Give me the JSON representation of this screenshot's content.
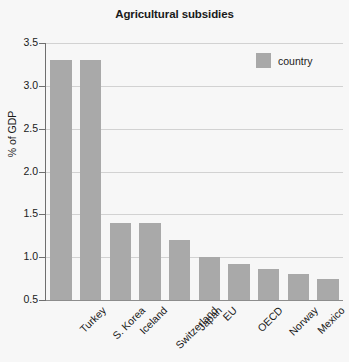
{
  "chart_data": {
    "type": "bar",
    "title": "Agricultural subsidies",
    "xlabel": "",
    "ylabel": "% of GDP",
    "ylim": [
      0.5,
      3.5
    ],
    "ytick_labels": [
      "0.5",
      "1.0",
      "1.5",
      "2.0",
      "2.5",
      "3.0",
      "3.5"
    ],
    "ytick_values": [
      0.5,
      1.0,
      1.5,
      2.0,
      2.5,
      3.0,
      3.5
    ],
    "grid": true,
    "legend": {
      "position": "top-right",
      "entries": [
        {
          "label": "country",
          "color": "#a9a9a9"
        }
      ]
    },
    "categories": [
      "Turkey",
      "S. Korea",
      "Iceland",
      "Switzerland",
      "Japan",
      "EU",
      "OECD",
      "Norway",
      "Mexico",
      "United States"
    ],
    "series": [
      {
        "name": "country",
        "color": "#a9a9a9",
        "values": [
          3.3,
          3.3,
          1.4,
          1.4,
          1.2,
          1.0,
          0.92,
          0.86,
          0.8,
          0.75
        ]
      }
    ]
  },
  "colors": {
    "background": "#f7f7f7",
    "bar": "#a9a9a9",
    "gridline": "#d2d2d2",
    "axis": "#6f6f6f",
    "text": "#1a1a1a"
  }
}
